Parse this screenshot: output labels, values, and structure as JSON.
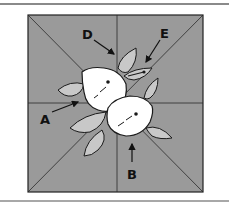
{
  "figure": {
    "background_color": "#ffffff",
    "block_color": "#9a9a9a",
    "leaf_color": "#c8c8c8",
    "lemon_color": "#ffffff",
    "line_color": "#1a1a1a",
    "labels": [
      {
        "id": "A",
        "text": "A"
      },
      {
        "id": "B",
        "text": "B"
      },
      {
        "id": "D",
        "text": "D"
      },
      {
        "id": "E",
        "text": "E"
      }
    ]
  }
}
